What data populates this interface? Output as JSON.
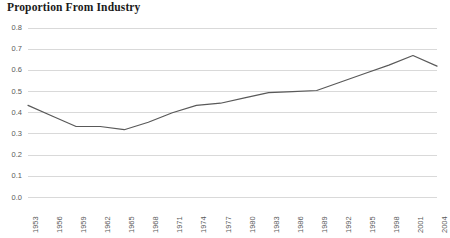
{
  "chart_data": {
    "type": "line",
    "title": "Proportion From Industry",
    "xlabel": "",
    "ylabel": "",
    "grid": true,
    "legend": false,
    "line_color": "#595959",
    "grid_color": "#d9d9d9",
    "axis_label_color": "#5a5a5a",
    "xlim": [
      1953,
      2004
    ],
    "ylim": [
      0.0,
      0.8
    ],
    "ytick_labels": [
      "0.8",
      "0.7",
      "0.6",
      "0.5",
      "0.4",
      "0.3",
      "0.2",
      "0.1",
      "0.0"
    ],
    "ytick_values": [
      0.8,
      0.7,
      0.6,
      0.5,
      0.4,
      0.3,
      0.2,
      0.1,
      0.0
    ],
    "categories": [
      "1953",
      "1956",
      "1959",
      "1962",
      "1965",
      "1968",
      "1971",
      "1974",
      "1977",
      "1980",
      "1983",
      "1986",
      "1989",
      "1992",
      "1995",
      "1998",
      "2001",
      "2004"
    ],
    "x": [
      1953,
      1956,
      1959,
      1962,
      1965,
      1968,
      1971,
      1974,
      1977,
      1980,
      1983,
      1986,
      1989,
      1992,
      1995,
      1998,
      2001,
      2004
    ],
    "values": [
      0.435,
      0.385,
      0.335,
      0.335,
      0.32,
      0.355,
      0.4,
      0.435,
      0.445,
      0.47,
      0.495,
      0.5,
      0.505,
      0.545,
      0.585,
      0.625,
      0.67,
      0.62
    ]
  }
}
